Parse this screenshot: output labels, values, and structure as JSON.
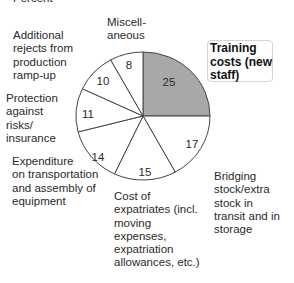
{
  "chart_data": {
    "type": "pie",
    "title": "Percent",
    "unit": "Percent",
    "start_angle_deg": 0,
    "direction": "clockwise",
    "highlight_color": "#a8a8a8",
    "slices": [
      {
        "label": "Training costs (new staff)",
        "value": 25,
        "highlighted": true
      },
      {
        "label": "Bridging stock/extra stock in transit and in storage",
        "value": 17
      },
      {
        "label": "Cost of expatriates (incl. moving expenses, expatriation allowances, etc.)",
        "value": 15
      },
      {
        "label": "Expenditure on transportation and assembly of equipment",
        "value": 14
      },
      {
        "label": "Protection against risks/ insurance",
        "value": 11
      },
      {
        "label": "Additional rejects from production ramp-up",
        "value": 10
      },
      {
        "label": "Miscellaneous",
        "value": 8
      }
    ]
  },
  "header": {
    "unit_label": "Percent"
  },
  "labels": {
    "training": "Training\ncosts (new\nstaff)",
    "bridging": "Bridging\nstock/extra\nstock in\ntransit and in\nstorage",
    "expatriates": "Cost of\nexpatriates (incl.\nmoving\nexpenses,\nexpatriation\nallowances, etc.)",
    "expenditure": "Expenditure\non transportation\nand assembly of\nequipment",
    "protection": "Protection\nagainst\nrisks/\ninsurance",
    "rejects": "Additional\nrejects from\nproduction\nramp-up",
    "misc": "Miscell-\naneous"
  },
  "values": {
    "training": "25",
    "bridging": "17",
    "expatriates": "15",
    "expenditure": "14",
    "protection": "11",
    "rejects": "10",
    "misc": "8"
  }
}
